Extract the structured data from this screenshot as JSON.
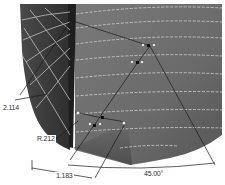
{
  "drawing": {
    "type": "CAD surface model with dimensions",
    "dimensions": [
      {
        "id": "dim-a",
        "label": "2.114"
      },
      {
        "id": "dim-b",
        "label": "R.212"
      },
      {
        "id": "dim-c",
        "label": "1.183"
      },
      {
        "id": "dim-d",
        "label": "45.00°"
      }
    ],
    "colors": {
      "surface_dark": "#3a3a3a",
      "surface_mid": "#6e6e6e",
      "surface_light": "#8a8a8a",
      "isoline": "#c8c8c8",
      "dim_line": "#222222",
      "background": "#ffffff"
    }
  }
}
